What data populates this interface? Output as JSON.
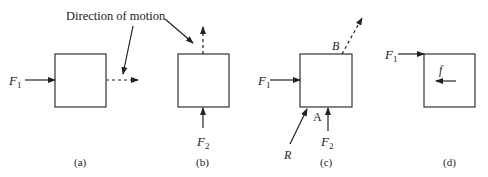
{
  "diagram": {
    "annotation": "Direction of motion",
    "panels": [
      {
        "caption": "(a)",
        "forces": [
          {
            "name": "F",
            "sub": "1",
            "direction": "right",
            "applied_at": "left side"
          }
        ],
        "motion": "right"
      },
      {
        "caption": "(b)",
        "forces": [
          {
            "name": "F",
            "sub": "2",
            "direction": "up",
            "applied_at": "bottom"
          }
        ],
        "motion": "up"
      },
      {
        "caption": "(c)",
        "forces": [
          {
            "name": "F",
            "sub": "1",
            "direction": "right",
            "applied_at": "left side"
          },
          {
            "name": "F",
            "sub": "2",
            "direction": "up",
            "applied_at": "bottom"
          },
          {
            "name": "R",
            "sub": "",
            "direction": "up-right",
            "applied_at": "corner A"
          }
        ],
        "points": [
          "A",
          "B"
        ],
        "motion": "up-right from B"
      },
      {
        "caption": "(d)",
        "forces": [
          {
            "name": "F",
            "sub": "1",
            "direction": "right",
            "applied_at": "top-left corner"
          },
          {
            "name": "f",
            "sub": "",
            "direction": "left",
            "applied_at": "inside"
          }
        ]
      }
    ],
    "labels": {
      "F": "F",
      "sub1": "1",
      "sub2": "2",
      "R": "R",
      "A": "A",
      "B": "B",
      "f": "f"
    }
  }
}
